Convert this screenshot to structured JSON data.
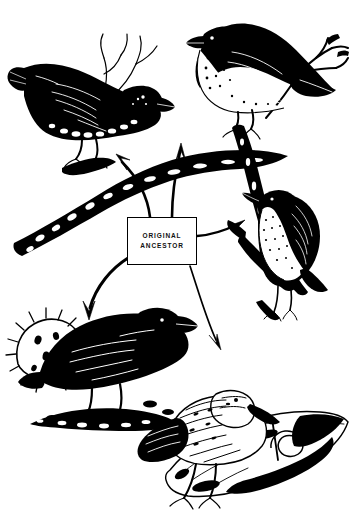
{
  "figure": {
    "title": "Adaptive radiation of Darwin's finches",
    "background_color": "#ffffff",
    "ink_color": "#000000",
    "width": 350,
    "height": 527
  },
  "center_label": {
    "name": "original-ancestor",
    "line1": "ORIGINAL",
    "line2": "ANCESTOR",
    "box": {
      "x": 127,
      "y": 217,
      "width": 70,
      "height": 48
    }
  },
  "birds": [
    {
      "id": "upper-left-finch",
      "position": "top-left",
      "description": "Dark large-beaked ground finch perched on a lichen-covered branch, facing right",
      "features": [
        "thick conical beak",
        "dark plumage",
        "speckled white underside",
        "perched on branch"
      ]
    },
    {
      "id": "upper-right-finch",
      "position": "top-right",
      "description": "Finch with dark back and pale speckled breast facing left on a forked twig",
      "features": [
        "pointed beak",
        "white spotted breast",
        "long tail",
        "forked branch perch"
      ]
    },
    {
      "id": "right-warbler-finch",
      "position": "middle-right",
      "description": "Small warbler finch with slender beak clinging to a vertical branch",
      "features": [
        "slender pointed beak",
        "mottled breast",
        "vertical stem perch"
      ]
    },
    {
      "id": "lower-left-cactus-finch",
      "position": "bottom-left",
      "description": "Black cactus ground finch standing on rocky ground beside a spiny cactus pad",
      "features": [
        "all-black plumage",
        "stout beak",
        "spiny cactus pad",
        "rocky ground"
      ]
    },
    {
      "id": "lower-right-woodpecker-finch",
      "position": "bottom-center-right",
      "description": "Woodpecker finch holding a cactus-spine twig tool in its beak on a fallen log",
      "features": [
        "long straight beak",
        "twig tool",
        "streaked plumage",
        "fallen log with knot"
      ]
    }
  ],
  "arrows": [
    {
      "id": "arrow-to-upper-left",
      "from": "original-ancestor",
      "to": "upper-left-finch",
      "direction": "up-left"
    },
    {
      "id": "arrow-to-upper-right",
      "from": "original-ancestor",
      "to": "upper-right-finch",
      "direction": "up-right"
    },
    {
      "id": "arrow-to-right",
      "from": "original-ancestor",
      "to": "right-warbler-finch",
      "direction": "right"
    },
    {
      "id": "arrow-to-lower-left",
      "from": "original-ancestor",
      "to": "lower-left-cactus-finch",
      "direction": "down-left"
    },
    {
      "id": "arrow-to-lower-right",
      "from": "original-ancestor",
      "to": "lower-right-woodpecker-finch",
      "direction": "down-right"
    }
  ]
}
